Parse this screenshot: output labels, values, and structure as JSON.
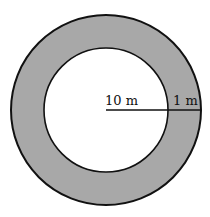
{
  "diagram": {
    "top_text_fragment": "",
    "labels": {
      "inner_radius": "10 m",
      "ring_width": "1 m"
    },
    "colors": {
      "ring_fill": "#a8a8a8",
      "stroke": "#111111",
      "inner_fill": "#ffffff"
    },
    "geometry": {
      "center": [
        106,
        110
      ],
      "outer_radius": 95,
      "inner_radius": 62
    }
  }
}
